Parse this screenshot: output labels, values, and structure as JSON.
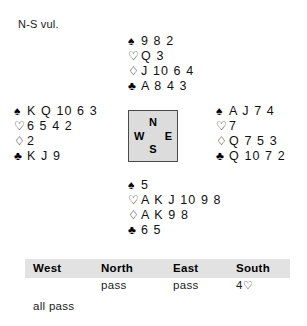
{
  "vulnerability": "N-S vul.",
  "suit_symbols": {
    "spade": "♠",
    "heart": "♡",
    "diamond": "♢",
    "club": "♣"
  },
  "hands": {
    "north": {
      "label": "North",
      "spades": "9 8 2",
      "hearts": "Q 3",
      "diamonds": "J 10 6 4",
      "clubs": "A 8 4 3"
    },
    "west": {
      "label": "West",
      "spades": "K Q 10 6 3",
      "hearts": "6 5 4 2",
      "diamonds": "2",
      "clubs": "K J 9"
    },
    "east": {
      "label": "East",
      "spades": "A J 7 4",
      "hearts": "7",
      "diamonds": "Q 7 5 3",
      "clubs": "Q 10 7 2"
    },
    "south": {
      "label": "South",
      "spades": "5",
      "hearts": "A K J 10 9 8",
      "diamonds": "A K 9 8",
      "clubs": "6 5"
    }
  },
  "compass": {
    "north": "N",
    "south": "S",
    "west": "W",
    "east": "E"
  },
  "auction": {
    "headers": {
      "west": "West",
      "north": "North",
      "east": "East",
      "south": "South"
    },
    "rows": [
      {
        "west": "",
        "north": "pass",
        "east": "pass",
        "south_level": "4",
        "south_suit": "♡"
      }
    ],
    "final_note": "all pass"
  },
  "colors": {
    "compass_fill": "#dcdcdc",
    "compass_border": "#4a4a4a",
    "auction_header_band": "#e2e2e2",
    "text": "#111111"
  }
}
